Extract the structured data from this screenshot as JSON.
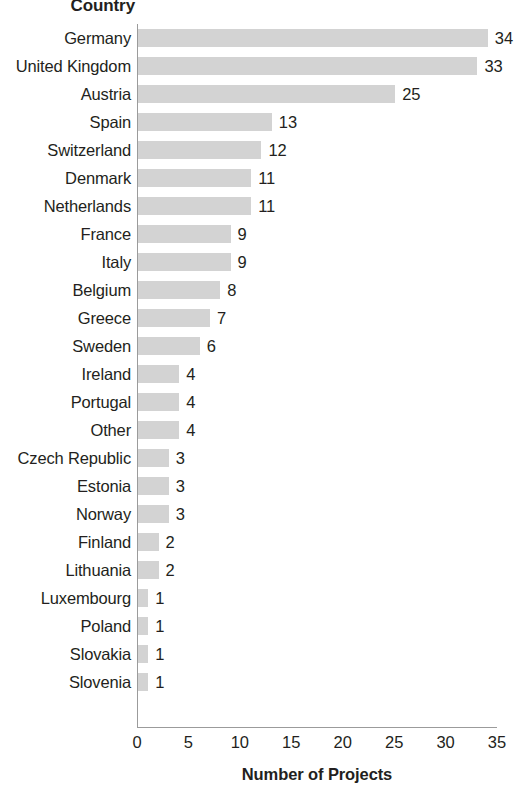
{
  "chart_data": {
    "type": "bar",
    "orientation": "horizontal",
    "title": "",
    "xlabel": "Number of Projects",
    "ylabel": "Country",
    "categories": [
      "Germany",
      "United Kingdom",
      "Austria",
      "Spain",
      "Switzerland",
      "Denmark",
      "Netherlands",
      "France",
      "Italy",
      "Belgium",
      "Greece",
      "Sweden",
      "Ireland",
      "Portugal",
      "Other",
      "Czech Republic",
      "Estonia",
      "Norway",
      "Finland",
      "Lithuania",
      "Luxembourg",
      "Poland",
      "Slovakia",
      "Slovenia"
    ],
    "values": [
      34,
      33,
      25,
      13,
      12,
      11,
      11,
      9,
      9,
      8,
      7,
      6,
      4,
      4,
      4,
      3,
      3,
      3,
      2,
      2,
      1,
      1,
      1,
      1
    ],
    "value_labels": [
      "34",
      "33",
      "25",
      "13",
      "12",
      "11",
      "11",
      "9",
      "9",
      "8",
      "7",
      "6",
      "4",
      "4",
      "4",
      "3",
      "3",
      "3",
      "2",
      "2",
      "1",
      "1",
      "1",
      "1"
    ],
    "xlim": [
      0,
      35
    ],
    "xticks": [
      0,
      5,
      10,
      15,
      20,
      25,
      30,
      35
    ],
    "xtick_labels": [
      "0",
      "5",
      "10",
      "15",
      "20",
      "25",
      "30",
      "35"
    ],
    "grid": false,
    "legend": false,
    "bar_color": "#d3d3d3",
    "text_color": "#231f20",
    "axis_color": "#9b9b9b"
  }
}
